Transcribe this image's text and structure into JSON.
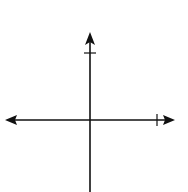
{
  "figure": {
    "top_partial_label": "y",
    "axes": {
      "x_label": "x",
      "y_label": "y",
      "x_tick_label": "4",
      "y_tick_label": "4",
      "origin_px": [
        90,
        120
      ],
      "unit_px": 16.7,
      "x_range": [
        -4,
        4.4
      ],
      "y_range": [
        -4.3,
        4.3
      ]
    },
    "preimage": {
      "name": "black quadrilateral",
      "color": "#111111",
      "edge_color": "#8a8a8a",
      "vertices": [
        [
          -2,
          1
        ],
        [
          1,
          -1
        ],
        [
          -1,
          -3
        ],
        [
          -3,
          -2
        ]
      ]
    },
    "image": {
      "name": "gray quadrilateral",
      "color": "#8f8f8f",
      "edge_color": "#8a8a8a",
      "vertices": [
        [
          -1,
          1
        ],
        [
          1,
          3
        ],
        [
          3,
          2
        ],
        [
          2,
          -1
        ]
      ]
    }
  }
}
